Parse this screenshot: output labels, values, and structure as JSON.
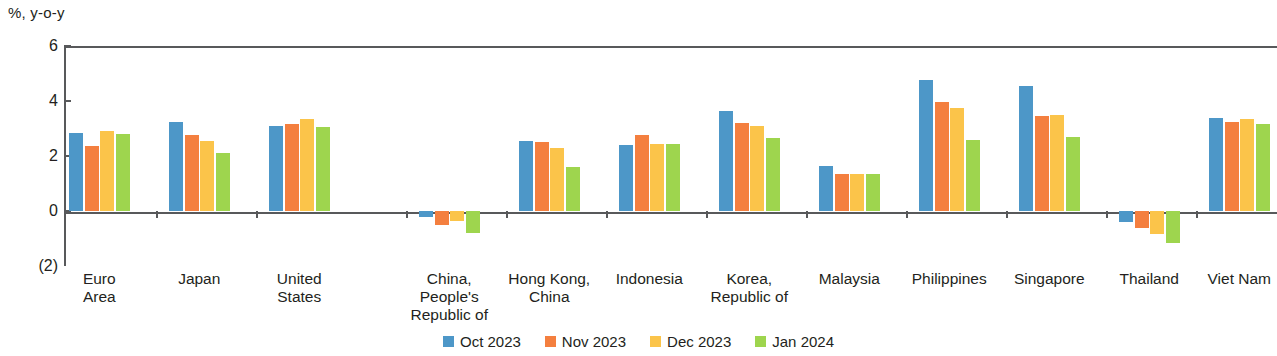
{
  "chart_data": {
    "type": "bar",
    "title": "",
    "subtitle": "",
    "xlabel": "",
    "ylabel": "%, y-o-y",
    "ylim": [
      -2,
      6
    ],
    "ytick_labels": [
      "6",
      "4",
      "2",
      "0",
      "(2)"
    ],
    "ytick_values": [
      6,
      4,
      2,
      0,
      -2
    ],
    "grid": false,
    "legend_position": "bottom-center",
    "categories": [
      "Euro\nArea",
      "Japan",
      "United\nStates",
      "China,\nPeople's\nRepublic of",
      "Hong Kong,\nChina",
      "Indonesia",
      "Korea,\nRepublic of",
      "Malaysia",
      "Philippines",
      "Singapore",
      "Thailand",
      "Viet Nam"
    ],
    "series": [
      {
        "name": "Oct 2023",
        "color": "#4d97c8",
        "values": [
          2.85,
          3.25,
          3.1,
          -0.2,
          2.55,
          2.4,
          3.65,
          1.65,
          4.75,
          4.55,
          -0.4,
          3.4
        ]
      },
      {
        "name": "Nov 2023",
        "color": "#f47f3f",
        "values": [
          2.35,
          2.75,
          3.15,
          -0.5,
          2.5,
          2.75,
          3.2,
          1.35,
          3.95,
          3.45,
          -0.6,
          3.25
        ]
      },
      {
        "name": "Dec 2023",
        "color": "#fbc44a",
        "values": [
          2.9,
          2.55,
          3.35,
          -0.35,
          2.3,
          2.45,
          3.1,
          1.35,
          3.75,
          3.5,
          -0.85,
          3.35
        ]
      },
      {
        "name": "Jan 2024",
        "color": "#9ed54e",
        "values": [
          2.8,
          2.1,
          3.05,
          -0.8,
          1.6,
          2.45,
          2.65,
          1.35,
          2.6,
          2.7,
          -1.15,
          3.15
        ]
      }
    ]
  },
  "legend": {
    "items": [
      {
        "label": "Oct 2023",
        "color": "#4d97c8"
      },
      {
        "label": "Nov 2023",
        "color": "#f47f3f"
      },
      {
        "label": "Dec 2023",
        "color": "#fbc44a"
      },
      {
        "label": "Jan 2024",
        "color": "#9ed54e"
      }
    ]
  },
  "axis": {
    "unit_caption": "%, y-o-y"
  }
}
